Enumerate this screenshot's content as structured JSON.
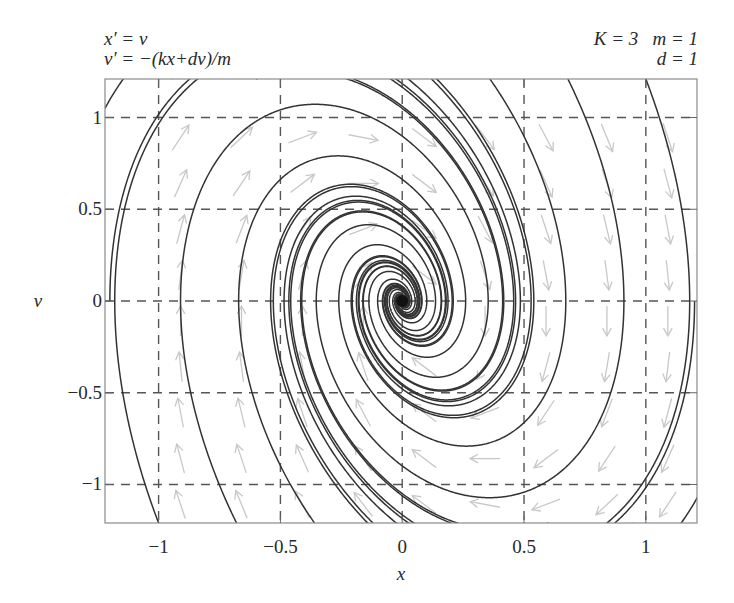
{
  "header": {
    "equations": [
      "x′ = ν",
      "ν′ = −(kx+dν)/m"
    ],
    "params_line1": "K = 3   m = 1",
    "params_line2": "d = 1"
  },
  "chart_data": {
    "type": "line",
    "subtype": "phase-portrait",
    "title": "",
    "system": {
      "x_prime": "v",
      "v_prime": "-(k*x + d*v)/m",
      "K": 3,
      "m": 1,
      "d": 1
    },
    "xlabel": "x",
    "ylabel": "ν",
    "xlim": [
      -1.22,
      1.21
    ],
    "ylim": [
      -1.21,
      1.21
    ],
    "xticks": [
      -1,
      -0.5,
      0,
      0.5,
      1
    ],
    "xtick_labels": [
      "−1",
      "−0.5",
      "0",
      "0.5",
      "1"
    ],
    "yticks": [
      1,
      0.5,
      0,
      -0.5,
      -1
    ],
    "ytick_labels": [
      "1",
      "0.5",
      "0",
      "−0.5",
      "−1"
    ],
    "grid": true,
    "grid_style": "dashed",
    "equilibrium": [
      0,
      0
    ],
    "equilibrium_type": "stable spiral",
    "trajectory_starts": [
      [
        -1.22,
        1.05
      ],
      [
        -1.2,
        0.0
      ],
      [
        -1.0,
        -1.21
      ],
      [
        -0.68,
        -1.21
      ],
      [
        -0.36,
        -1.21
      ],
      [
        -0.12,
        -1.21
      ],
      [
        -0.95,
        1.21
      ],
      [
        -0.6,
        1.21
      ],
      [
        -0.2,
        1.21
      ],
      [
        1.22,
        -1.05
      ],
      [
        1.2,
        0.0
      ],
      [
        1.0,
        1.21
      ],
      [
        0.68,
        1.21
      ],
      [
        0.36,
        1.21
      ],
      [
        0.12,
        1.21
      ],
      [
        0.95,
        -1.21
      ],
      [
        0.6,
        -1.21
      ],
      [
        0.2,
        -1.21
      ]
    ],
    "direction_field": {
      "x": [
        -1.0,
        -0.75,
        -0.5,
        -0.25,
        0.0,
        0.25,
        0.5,
        0.75,
        1.0
      ],
      "y": [
        -1.0,
        -0.75,
        -0.5,
        -0.25,
        0.0,
        0.25,
        0.5,
        0.75,
        1.0
      ],
      "arrow_color": "#c8c8c8"
    },
    "colors": {
      "trajectory": "#333333",
      "grid": "#555555",
      "frame": "#8a8a8a",
      "equilibrium": "#111111"
    }
  }
}
